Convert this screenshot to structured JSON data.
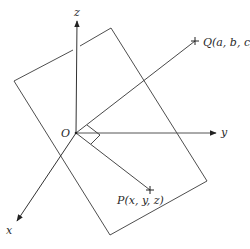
{
  "diagram": {
    "type": "3d-coordinate-geometry",
    "labels": {
      "origin": "O",
      "x_axis": "x",
      "y_axis": "y",
      "z_axis": "z",
      "point_q": "Q(a, b, c)",
      "point_p": "P(x, y, z)"
    },
    "colors": {
      "stroke": "#333333",
      "background": "#ffffff"
    }
  }
}
